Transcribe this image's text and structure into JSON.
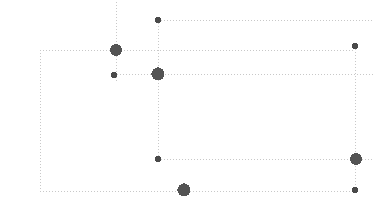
{
  "diagram": {
    "name": "node-link-dotted-graph",
    "type": "node-link",
    "canvas": {
      "width": 373,
      "height": 212,
      "background": "#ffffff"
    },
    "style": {
      "edge_color": "#c8c8c8",
      "edge_width": 1,
      "edge_dash": "1,2",
      "node_color": "#545454",
      "node_small_color": "#4a4a4a"
    },
    "nodes": [
      {
        "id": "n1",
        "label": "",
        "cx": 158,
        "cy": 20,
        "r": 3.2,
        "size": "small"
      },
      {
        "id": "n2",
        "label": "",
        "cx": 116,
        "cy": 50,
        "r": 6.0,
        "size": "large"
      },
      {
        "id": "n3",
        "label": "",
        "cx": 355,
        "cy": 46,
        "r": 3.2,
        "size": "small"
      },
      {
        "id": "n4",
        "label": "",
        "cx": 114,
        "cy": 75,
        "r": 3.0,
        "size": "small"
      },
      {
        "id": "n5",
        "label": "",
        "cx": 158,
        "cy": 74,
        "r": 6.6,
        "size": "large"
      },
      {
        "id": "n6",
        "label": "",
        "cx": 158,
        "cy": 159,
        "r": 3.0,
        "size": "small"
      },
      {
        "id": "n7",
        "label": "",
        "cx": 356,
        "cy": 159,
        "r": 6.0,
        "size": "large"
      },
      {
        "id": "n8",
        "label": "",
        "cx": 184,
        "cy": 190,
        "r": 6.6,
        "size": "large"
      },
      {
        "id": "n9",
        "label": "",
        "cx": 355,
        "cy": 190,
        "r": 3.0,
        "size": "small"
      }
    ],
    "edges": [
      {
        "id": "e1",
        "name": "vertical-top-through-n2",
        "x1": 116,
        "y1": 2,
        "x2": 116,
        "y2": 82
      },
      {
        "id": "e2",
        "name": "vertical-n1-to-n6",
        "x1": 158,
        "y1": 20,
        "x2": 158,
        "y2": 159
      },
      {
        "id": "e3",
        "name": "horizontal-n1-right-edge",
        "x1": 158,
        "y1": 20,
        "x2": 373,
        "y2": 20
      },
      {
        "id": "e4",
        "name": "horizontal-row-n2",
        "x1": 40,
        "y1": 50,
        "x2": 355,
        "y2": 50
      },
      {
        "id": "e5",
        "name": "horizontal-row-n5",
        "x1": 114,
        "y1": 74,
        "x2": 373,
        "y2": 74
      },
      {
        "id": "e6",
        "name": "vertical-left-rect-edge",
        "x1": 40,
        "y1": 50,
        "x2": 40,
        "y2": 191
      },
      {
        "id": "e7",
        "name": "horizontal-bottom-rect",
        "x1": 40,
        "y1": 191,
        "x2": 355,
        "y2": 191
      },
      {
        "id": "e8",
        "name": "horizontal-row-n6",
        "x1": 158,
        "y1": 159,
        "x2": 373,
        "y2": 159
      },
      {
        "id": "e9",
        "name": "vertical-right-column",
        "x1": 355,
        "y1": 46,
        "x2": 355,
        "y2": 191
      }
    ]
  }
}
